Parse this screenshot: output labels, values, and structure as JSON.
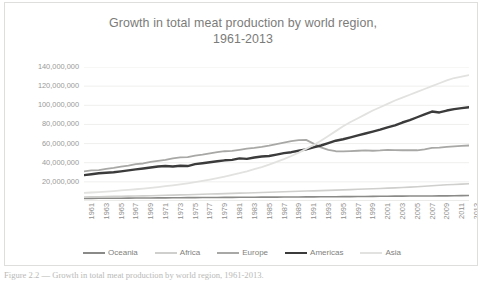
{
  "chart_data": {
    "type": "line",
    "title": "Growth in total meat production by world region, 1961-2013",
    "title_line1": "Growth in total meat production by world region,",
    "title_line2": "1961-2013",
    "subtitle": "",
    "xlabel": "",
    "ylabel": "",
    "grid": true,
    "legend_position": "bottom",
    "ylim": [
      0,
      140000000
    ],
    "ytick_labels": [
      "140,000,000",
      "120,000,000",
      "100,000,000",
      "80,000,000",
      "60,000,000",
      "40,000,000",
      "20,000,000"
    ],
    "ytick_values": [
      140000000,
      120000000,
      100000000,
      80000000,
      60000000,
      40000000,
      20000000
    ],
    "xtick_labels": [
      "1961",
      "1963",
      "1965",
      "1967",
      "1969",
      "1971",
      "1973",
      "1975",
      "1977",
      "1979",
      "1981",
      "1983",
      "1985",
      "1987",
      "1989",
      "1991",
      "1993",
      "1995",
      "1997",
      "1999",
      "2001",
      "2003",
      "2005",
      "2007",
      "2009",
      "2011",
      "2013"
    ],
    "x": [
      1961,
      1962,
      1963,
      1964,
      1965,
      1966,
      1967,
      1968,
      1969,
      1970,
      1971,
      1972,
      1973,
      1974,
      1975,
      1976,
      1977,
      1978,
      1979,
      1980,
      1981,
      1982,
      1983,
      1984,
      1985,
      1986,
      1987,
      1988,
      1989,
      1990,
      1991,
      1992,
      1993,
      1994,
      1995,
      1996,
      1997,
      1998,
      1999,
      2000,
      2001,
      2002,
      2003,
      2004,
      2005,
      2006,
      2007,
      2008,
      2009,
      2010,
      2011,
      2012,
      2013
    ],
    "series": [
      {
        "name": "Oceania",
        "color": "#8a8a88",
        "width": 1.6,
        "values": [
          2600000,
          2700000,
          2800000,
          2850000,
          2900000,
          2950000,
          3000000,
          3100000,
          3150000,
          3200000,
          3250000,
          3300000,
          3350000,
          3400000,
          3500000,
          3550000,
          3600000,
          3650000,
          3700000,
          3750000,
          3800000,
          3850000,
          3900000,
          3950000,
          4000000,
          4050000,
          4100000,
          4150000,
          4200000,
          4250000,
          4300000,
          4350000,
          4400000,
          4450000,
          4500000,
          4550000,
          4600000,
          4650000,
          4700000,
          4800000,
          4900000,
          5000000,
          5050000,
          5100000,
          5150000,
          5200000,
          5250000,
          5300000,
          5350000,
          5400000,
          5500000,
          5600000,
          5700000
        ]
      },
      {
        "name": "Africa",
        "color": "#cfcfcd",
        "width": 1.6,
        "values": [
          4200000,
          4350000,
          4500000,
          4650000,
          4800000,
          4950000,
          5100000,
          5250000,
          5400000,
          5550000,
          5750000,
          5950000,
          6150000,
          6350000,
          6550000,
          6800000,
          7000000,
          7250000,
          7450000,
          7700000,
          7950000,
          8200000,
          8400000,
          8600000,
          8850000,
          9100000,
          9350000,
          9600000,
          9900000,
          10200000,
          10400000,
          10600000,
          10850000,
          11100000,
          11400000,
          11650000,
          11900000,
          12200000,
          12500000,
          12800000,
          13100000,
          13400000,
          13700000,
          14100000,
          14500000,
          14900000,
          15400000,
          15900000,
          16400000,
          17000000,
          17300000,
          17600000,
          18000000
        ]
      },
      {
        "name": "Europe",
        "color": "#a8a8a6",
        "width": 1.8,
        "values": [
          31000000,
          32000000,
          32200000,
          33500000,
          34500000,
          35800000,
          37000000,
          38500000,
          39200000,
          40800000,
          42000000,
          43000000,
          44500000,
          45500000,
          45800000,
          47500000,
          48500000,
          49800000,
          51000000,
          52000000,
          52300000,
          53500000,
          54800000,
          55500000,
          56500000,
          57800000,
          59500000,
          61000000,
          62500000,
          63500000,
          63800000,
          60000000,
          56000000,
          53500000,
          52000000,
          51800000,
          52200000,
          52500000,
          52800000,
          52500000,
          52800000,
          53500000,
          53200000,
          53000000,
          53200000,
          53000000,
          54000000,
          55500000,
          55800000,
          56500000,
          57000000,
          57500000,
          58000000
        ]
      },
      {
        "name": "Americas",
        "color": "#3b3b3b",
        "width": 2.4,
        "values": [
          27000000,
          28000000,
          29000000,
          29500000,
          30000000,
          31000000,
          32000000,
          33000000,
          34000000,
          35000000,
          36000000,
          36500000,
          36000000,
          36800000,
          36500000,
          38500000,
          39500000,
          40500000,
          41500000,
          42500000,
          43000000,
          44500000,
          44000000,
          45500000,
          46500000,
          47000000,
          48500000,
          50000000,
          51000000,
          52500000,
          54000000,
          56000000,
          58000000,
          60500000,
          63000000,
          64500000,
          66500000,
          68500000,
          70500000,
          72500000,
          74500000,
          77000000,
          79000000,
          82000000,
          84500000,
          87500000,
          90500000,
          93500000,
          92500000,
          94500000,
          96000000,
          97000000,
          98000000
        ]
      },
      {
        "name": "Asia",
        "color": "#e2e2e0",
        "width": 1.8,
        "values": [
          8500000,
          8900000,
          9300000,
          9800000,
          10400000,
          11000000,
          11600000,
          12300000,
          13000000,
          13800000,
          14600000,
          15500000,
          16400000,
          17400000,
          18500000,
          19700000,
          21000000,
          22400000,
          23900000,
          25500000,
          27200000,
          29000000,
          31000000,
          33200000,
          35500000,
          38000000,
          40800000,
          43800000,
          47000000,
          50500000,
          54500000,
          58500000,
          63000000,
          68000000,
          73000000,
          78000000,
          82500000,
          86500000,
          90500000,
          94500000,
          98000000,
          101500000,
          105000000,
          108000000,
          111000000,
          114000000,
          117000000,
          120000000,
          123000000,
          126000000,
          128500000,
          130000000,
          131500000
        ]
      }
    ]
  },
  "legend": {
    "items": [
      {
        "label": "Oceania",
        "color": "#8a8a88",
        "thick": false
      },
      {
        "label": "Africa",
        "color": "#cfcfcd",
        "thick": false
      },
      {
        "label": "Europe",
        "color": "#a8a8a6",
        "thick": false
      },
      {
        "label": "Americas",
        "color": "#3b3b3b",
        "thick": true
      },
      {
        "label": "Asia",
        "color": "#e2e2e0",
        "thick": false
      }
    ]
  },
  "caption": {
    "text": "Figure 2.2 — Growth in total meat production by world region, 1961-2013."
  },
  "style": {
    "gridline_color": "#efefee",
    "axis_line_color": "#d6d6d4",
    "title_color": "#7b7b79",
    "tick_color": "#9a9a98",
    "frame_border": "#dededc",
    "background": "#ffffff"
  }
}
